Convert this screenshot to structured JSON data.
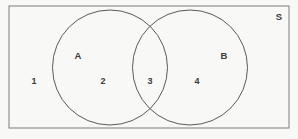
{
  "figure": {
    "name": "venn-diagram-two-sets",
    "background_color": "#f8f8f7",
    "universe": {
      "label": "S",
      "label_x": 279,
      "label_y": 17,
      "rect": {
        "x": 9,
        "y": 6,
        "width": 280,
        "height": 122
      },
      "stroke_color": "#7c7c7c"
    },
    "sets": [
      {
        "label": "A",
        "label_x": 78,
        "label_y": 56,
        "cx": 110,
        "cy": 67.5,
        "r": 57.5,
        "stroke_color": "#5a5a5a"
      },
      {
        "label": "B",
        "label_x": 224,
        "label_y": 56,
        "cx": 190,
        "cy": 67.5,
        "r": 57.5,
        "stroke_color": "#5a5a5a"
      }
    ],
    "regions": [
      {
        "label": "1",
        "meaning": "outside-A-and-B",
        "x": 34,
        "y": 82
      },
      {
        "label": "2",
        "meaning": "A-only",
        "x": 103,
        "y": 82
      },
      {
        "label": "3",
        "meaning": "A-intersect-B",
        "x": 150,
        "y": 82
      },
      {
        "label": "4",
        "meaning": "B-only",
        "x": 197,
        "y": 82
      }
    ]
  }
}
